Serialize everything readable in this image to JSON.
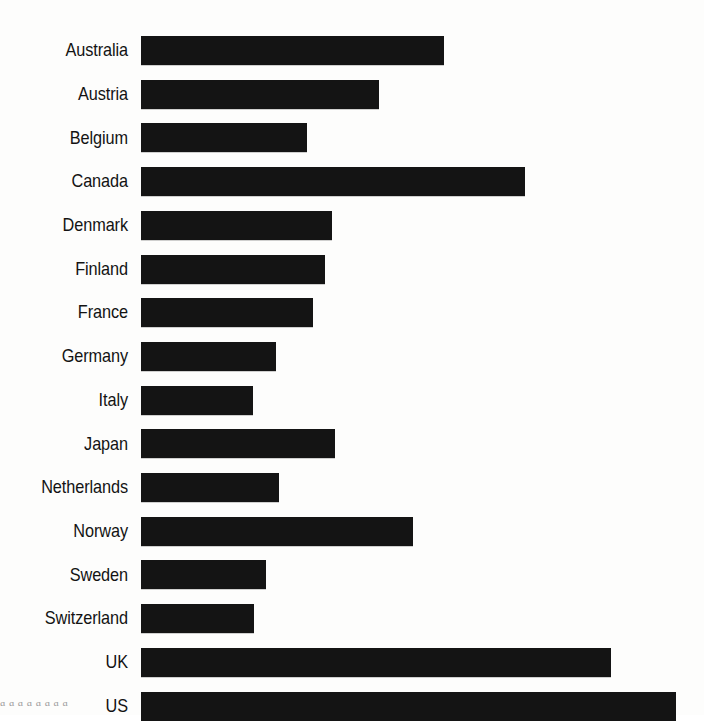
{
  "chart_data": {
    "type": "bar",
    "orientation": "horizontal",
    "title": "",
    "subtitle": "",
    "xlabel": "",
    "ylabel": "",
    "grid": false,
    "legend": null,
    "axis_ticks_visible": false,
    "value_labels_visible": false,
    "bar_color": "#141414",
    "background_color": "#fdfdfc",
    "xlim": [
      0,
      535
    ],
    "categories": [
      "Australia",
      "Austria",
      "Belgium",
      "Canada",
      "Denmark",
      "Finland",
      "France",
      "Germany",
      "Italy",
      "Japan",
      "Netherlands",
      "Norway",
      "Sweden",
      "Switzerland",
      "UK",
      "US"
    ],
    "values": [
      303,
      238,
      166,
      384,
      191,
      184,
      172,
      135,
      112,
      194,
      138,
      272,
      125,
      113,
      470,
      535
    ],
    "values_normalized_pct": [
      56.6,
      44.5,
      31.0,
      71.8,
      35.7,
      34.4,
      32.1,
      25.2,
      20.9,
      36.3,
      25.8,
      50.8,
      23.4,
      21.1,
      87.9,
      100.0
    ]
  },
  "bleed_text": "a     a                          a            a                                 a      a                a            a"
}
